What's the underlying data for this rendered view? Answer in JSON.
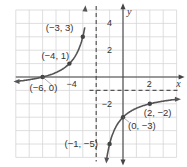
{
  "chart_data": {
    "type": "line",
    "title": "",
    "function": "y = -4/(x+2) - 1",
    "xlabel": "x",
    "ylabel": "y",
    "xlim": [
      -8,
      4
    ],
    "ylim": [
      -6,
      5
    ],
    "grid": true,
    "x_ticks": [
      {
        "value": -4,
        "label": "-4"
      },
      {
        "value": 2,
        "label": "2"
      }
    ],
    "y_ticks": [
      {
        "value": 4,
        "label": "4"
      },
      {
        "value": 2,
        "label": "2"
      },
      {
        "value": -2,
        "label": "-2"
      }
    ],
    "asymptotes": {
      "vertical": -2,
      "horizontal": -1
    },
    "points": [
      {
        "x": -6,
        "y": 0,
        "label": "(−6, 0)"
      },
      {
        "x": -4,
        "y": 1,
        "label": "(−4, 1)"
      },
      {
        "x": -3,
        "y": 3,
        "label": "(−3, 3)"
      },
      {
        "x": -1,
        "y": -5,
        "label": "(−1, −5)"
      },
      {
        "x": 0,
        "y": -3,
        "label": "(0, −3)"
      },
      {
        "x": 2,
        "y": -2,
        "label": "(2, −2)"
      }
    ],
    "colors": {
      "curve": "#555555",
      "grid": "#d6d6d6",
      "axis": "#444444",
      "asymptote": "#555555"
    }
  }
}
